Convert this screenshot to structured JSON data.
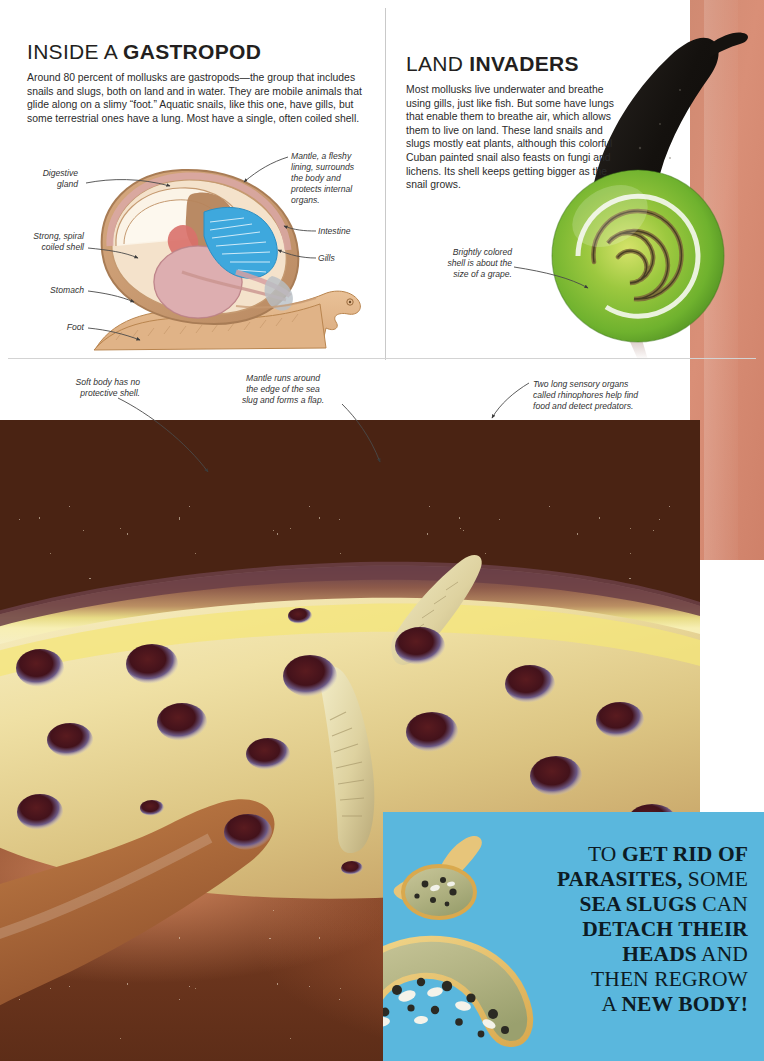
{
  "page": {
    "background": "#ffffff",
    "accent_blue": "#5ab7dd",
    "accent_terracotta": "#d08a72",
    "divider_color": "#c9c9c9"
  },
  "sections": {
    "gastropod": {
      "heading_light": "INSIDE A ",
      "heading_bold": "GASTROPOD",
      "body": "Around 80 percent of mollusks are gastropods—the group that includes snails and slugs, both on land and in water. They are mobile animals that glide along on a slimy “foot.” Aquatic snails, like this one, have gills, but some terrestrial ones have a lung. Most have a single, often coiled shell."
    },
    "land": {
      "heading_light": "LAND ",
      "heading_bold": "INVADERS",
      "body": "Most mollusks live underwater and breathe using gills, just like fish. But some have lungs that enable them to breathe air, which allows them to live on land. These land snails and slugs mostly eat plants, although this colorful Cuban painted snail also feasts on fungi and lichens. Its shell keeps getting bigger as the snail grows."
    }
  },
  "callouts": {
    "digestive_gland": "Digestive\ngland",
    "strong_spiral": "Strong, spiral\ncoiled shell",
    "stomach": "Stomach",
    "foot": "Foot",
    "mantle": "Mantle, a fleshy\nlining, surrounds\nthe body and\nprotects internal\norgans.",
    "intestine": "Intestine",
    "gills": "Gills",
    "shell_grape": "Brightly colored\nshell is about the\nsize of a grape.",
    "soft_body": "Soft body has no\nprotective shell.",
    "mantle_flap": "Mantle runs around\nthe edge of the sea\nslug and forms a flap.",
    "rhinophores": "Two long sensory organs\ncalled rhinophores help find\nfood and detect predators."
  },
  "factbox": {
    "line1_plain": "TO ",
    "line1_bold": "GET RID OF",
    "line2_bold": "PARASITES,",
    "line2_plain": " SOME",
    "line3_bold": "SEA SLUGS",
    "line3_plain": " CAN",
    "line4_bold": "DETACH THEIR",
    "line5_bold": "HEADS",
    "line5_plain": " AND",
    "line6_plain": "THEN REGROW",
    "line7_plain": "A ",
    "line7_bold": "NEW BODY!"
  }
}
